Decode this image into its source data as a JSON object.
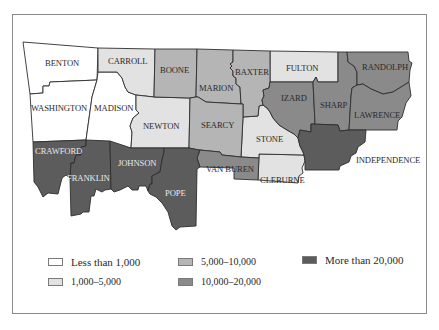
{
  "map": {
    "colors": {
      "less_than_1000": "#ffffff",
      "c1000_5000": "#e2e2e2",
      "c5000_10000": "#b5b5b5",
      "c10000_20000": "#8a8a8a",
      "more_than_20000": "#5c5c5c"
    },
    "counties": {
      "benton": "BENTON",
      "carroll": "CARROLL",
      "boone": "BOONE",
      "marion": "MARION",
      "baxter": "BAXTER",
      "fulton": "FULTON",
      "randolph": "RANDOLPH",
      "washington": "WASHINGTON",
      "madison": "MADISON",
      "newton": "NEWTON",
      "searcy": "SEARCY",
      "stone": "STONE",
      "izard": "IZARD",
      "sharp": "SHARP",
      "lawrence": "LAWRENCE",
      "independence": "INDEPENDENCE",
      "crawford": "CRAWFORD",
      "franklin": "FRANKLIN",
      "johnson": "JOHNSON",
      "pope": "POPE",
      "van_buren": "VAN BUREN",
      "cleburne": "CLEBURNE"
    }
  },
  "legend": {
    "items": [
      {
        "label": "Less than 1,000",
        "color": "#ffffff"
      },
      {
        "label": "1,000–5,000",
        "color": "#e2e2e2"
      },
      {
        "label": "5,000–10,000",
        "color": "#b5b5b5"
      },
      {
        "label": "10,000–20,000",
        "color": "#8a8a8a"
      },
      {
        "label": "More than 20,000",
        "color": "#5c5c5c"
      }
    ]
  }
}
